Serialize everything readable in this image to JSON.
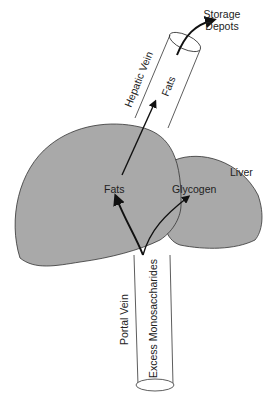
{
  "diagram": {
    "labels": {
      "storage_depots_line1": "Storage",
      "storage_depots_line2": "Depots",
      "hepatic_vein": "Hepatic Vein",
      "fats_vein": "Fats",
      "liver": "Liver",
      "fats_liver": "Fats",
      "glycogen": "Glycogen",
      "portal_vein": "Portal Vein",
      "excess_monosaccharides": "Excess Monosaccharides"
    },
    "colors": {
      "liver_fill": "#a9a9a9",
      "outline": "#333333",
      "background": "#ffffff"
    }
  }
}
